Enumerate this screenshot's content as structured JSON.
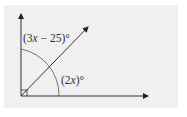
{
  "diagram": {
    "type": "angle-diagram",
    "labels": {
      "upper_angle": {
        "open": "(",
        "coef": "3",
        "var": "x",
        "rest": " − 25)°"
      },
      "lower_angle": {
        "open": "(",
        "coef": "2",
        "var": "x",
        "rest": ")°"
      }
    },
    "right_angle_marker": true,
    "colors": {
      "background": "#f0f0f0",
      "stroke": "#333333"
    }
  }
}
